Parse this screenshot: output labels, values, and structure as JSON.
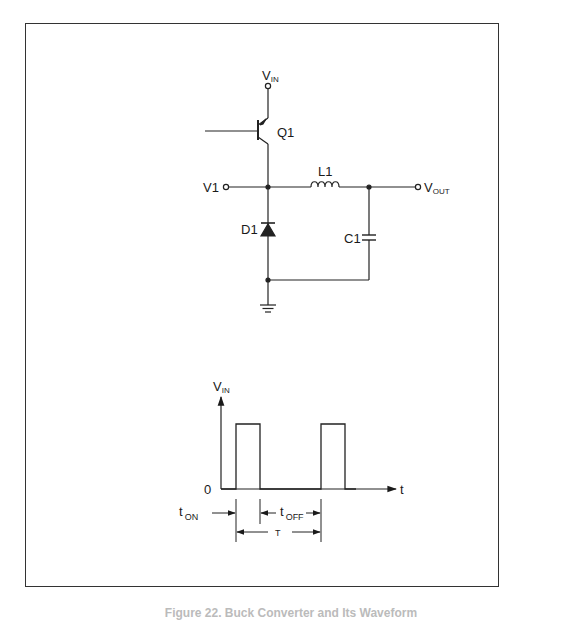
{
  "schematic": {
    "title": "Buck converter schematic",
    "labels": {
      "vin": "V",
      "vin_sub": "IN",
      "q1": "Q1",
      "v1": "V1",
      "l1": "L1",
      "vout": "V",
      "vout_sub": "OUT",
      "d1": "D1",
      "c1": "C1"
    },
    "components": [
      {
        "ref": "Q1",
        "type": "PNP transistor"
      },
      {
        "ref": "L1",
        "type": "inductor"
      },
      {
        "ref": "D1",
        "type": "diode"
      },
      {
        "ref": "C1",
        "type": "capacitor"
      }
    ]
  },
  "waveform": {
    "y_label": "V",
    "y_label_sub": "IN",
    "x_label": "t",
    "origin_label": "0",
    "t_on": "t",
    "t_on_sub": "ON",
    "t_off": "t",
    "t_off_sub": "OFF",
    "period": "T"
  },
  "caption": "Figure 22. Buck Converter and Its Waveform"
}
